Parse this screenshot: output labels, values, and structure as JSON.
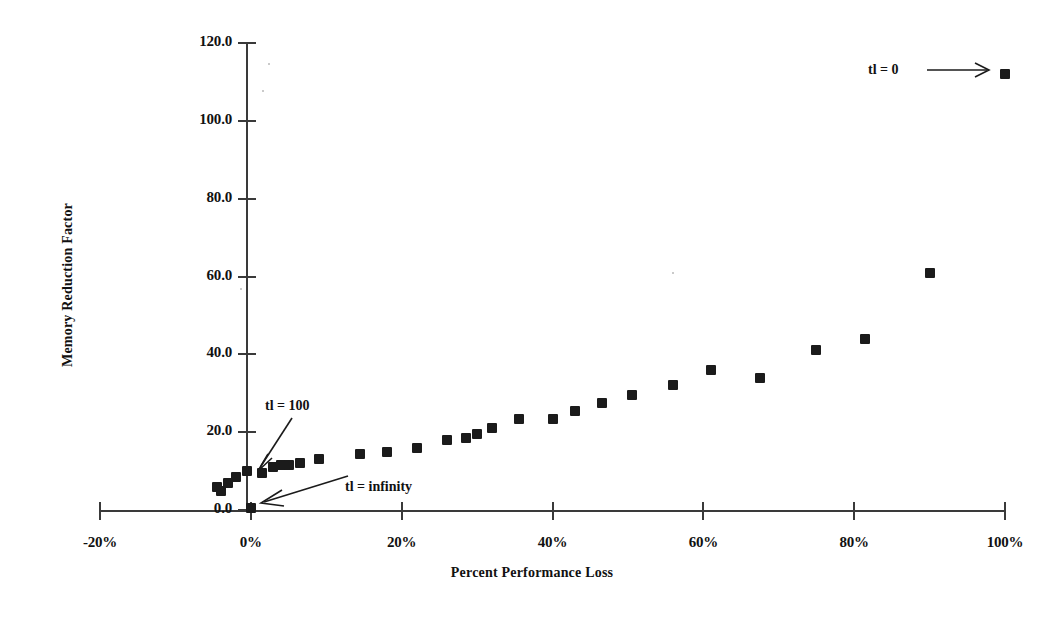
{
  "chart_data": {
    "type": "scatter",
    "title": "",
    "xlabel": "Percent Performance Loss",
    "ylabel": "Memory Reduction Factor",
    "xlim": [
      -20,
      100
    ],
    "ylim": [
      0,
      120
    ],
    "xtick_labels": [
      "-20%",
      "0%",
      "20%",
      "40%",
      "60%",
      "80%",
      "100%"
    ],
    "xtick_values": [
      -20,
      0,
      20,
      40,
      60,
      80,
      100
    ],
    "ytick_labels": [
      "0.0",
      "20.0",
      "40.0",
      "60.0",
      "80.0",
      "100.0",
      "120.0"
    ],
    "ytick_values": [
      0,
      20,
      40,
      60,
      80,
      100,
      120
    ],
    "grid": false,
    "legend": "none",
    "marker": "filled-square",
    "marker_color": "#1b1b1b",
    "series": [
      {
        "name": "memory reduction vs performance loss",
        "points": [
          [
            -4.5,
            6.0
          ],
          [
            -4.0,
            5.0
          ],
          [
            -3.0,
            7.0
          ],
          [
            -2.0,
            8.5
          ],
          [
            -0.5,
            10.0
          ],
          [
            0.0,
            0.5
          ],
          [
            1.5,
            9.5
          ],
          [
            3.0,
            11.0
          ],
          [
            4.0,
            11.5
          ],
          [
            5.0,
            11.5
          ],
          [
            6.5,
            12.0
          ],
          [
            9.0,
            13.0
          ],
          [
            14.5,
            14.5
          ],
          [
            18.0,
            15.0
          ],
          [
            22.0,
            16.0
          ],
          [
            26.0,
            18.0
          ],
          [
            28.5,
            18.5
          ],
          [
            30.0,
            19.5
          ],
          [
            32.0,
            21.0
          ],
          [
            35.5,
            23.5
          ],
          [
            40.0,
            23.5
          ],
          [
            43.0,
            25.5
          ],
          [
            46.5,
            27.5
          ],
          [
            50.5,
            29.5
          ],
          [
            56.0,
            32.0
          ],
          [
            61.0,
            36.0
          ],
          [
            67.5,
            34.0
          ],
          [
            75.0,
            41.0
          ],
          [
            81.5,
            44.0
          ],
          [
            90.0,
            61.0
          ],
          [
            100.0,
            112.0
          ]
        ]
      }
    ],
    "annotations": [
      {
        "id": "tl-zero",
        "text": "tl = 0",
        "points_to": [
          100.0,
          112.0
        ]
      },
      {
        "id": "tl-hundred",
        "text": "tl = 100",
        "points_to": [
          1.5,
          9.5
        ]
      },
      {
        "id": "tl-infinity",
        "text": "tl = infinity",
        "points_to": [
          0.0,
          0.5
        ]
      }
    ]
  }
}
